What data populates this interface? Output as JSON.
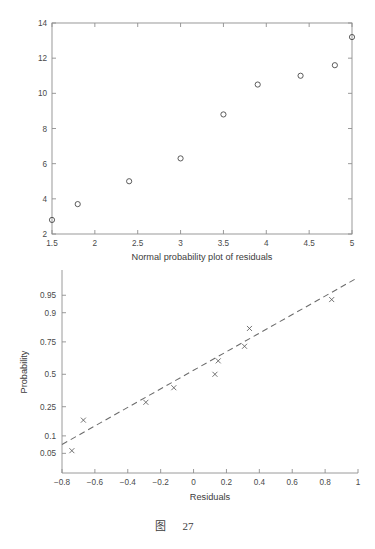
{
  "caption": {
    "prefix": "图",
    "number": "27"
  },
  "chart_data": [
    {
      "id": "residuals-scatter",
      "type": "scatter",
      "title": "",
      "subtitle": "",
      "xlabel": "Normal probability plot of residuals",
      "ylabel": "",
      "xlim": [
        1.5,
        5
      ],
      "ylim": [
        2,
        14
      ],
      "xticks": [
        "1.5",
        "2",
        "2.5",
        "3",
        "3.5",
        "4",
        "4.5",
        "5"
      ],
      "xtick_values": [
        1.5,
        2,
        2.5,
        3,
        3.5,
        4,
        4.5,
        5
      ],
      "yticks": [
        "2",
        "4",
        "6",
        "8",
        "10",
        "12",
        "14"
      ],
      "ytick_values": [
        2,
        4,
        6,
        8,
        10,
        12,
        14
      ],
      "grid": false,
      "legend": "none",
      "marker": "open-circle",
      "marker_color": "#4a4a4a",
      "x": [
        1.5,
        1.8,
        2.4,
        3.0,
        3.5,
        3.9,
        4.4,
        4.8,
        5.0
      ],
      "y": [
        2.8,
        3.7,
        5.0,
        6.3,
        8.8,
        10.5,
        11.0,
        11.6,
        13.2
      ],
      "points": [
        {
          "x": 1.5,
          "y": 2.8
        },
        {
          "x": 1.8,
          "y": 3.7
        },
        {
          "x": 2.4,
          "y": 5.0
        },
        {
          "x": 3.0,
          "y": 6.3
        },
        {
          "x": 3.5,
          "y": 8.8
        },
        {
          "x": 3.9,
          "y": 10.5
        },
        {
          "x": 4.4,
          "y": 11.0
        },
        {
          "x": 4.8,
          "y": 11.6
        },
        {
          "x": 5.0,
          "y": 13.2
        }
      ]
    },
    {
      "id": "normal-probability-plot",
      "type": "scatter",
      "title": "",
      "subtitle": "",
      "xlabel": "Residuals",
      "ylabel": "Probability",
      "xlim": [
        -0.8,
        1.0
      ],
      "ylim": [
        0.02,
        0.98
      ],
      "xticks": [
        "−0.8",
        "−0.6",
        "−0.4",
        "−0.2",
        "0",
        "0.2",
        "0.4",
        "0.6",
        "0.8",
        "1"
      ],
      "xtick_values": [
        -0.8,
        -0.6,
        -0.4,
        -0.2,
        0,
        0.2,
        0.4,
        0.6,
        0.8,
        1.0
      ],
      "yticks": [
        "0.05",
        "0.1",
        "0.25",
        "0.5",
        "0.75",
        "0.9",
        "0.95"
      ],
      "ytick_values": [
        0.05,
        0.1,
        0.25,
        0.5,
        0.75,
        0.9,
        0.95
      ],
      "yscale": "normal-probability",
      "grid": false,
      "legend": "none",
      "marker": "cross",
      "marker_color": "#5a5a5a",
      "reference_line": {
        "style": "dashed",
        "color": "#6b6b6b",
        "x": [
          -0.8,
          1.0
        ],
        "y": [
          0.072,
          0.978
        ]
      },
      "x": [
        -0.74,
        -0.67,
        -0.29,
        -0.12,
        0.13,
        0.15,
        0.31,
        0.34,
        0.84
      ],
      "y": [
        0.056,
        0.17,
        0.28,
        0.39,
        0.5,
        0.61,
        0.72,
        0.83,
        0.94
      ],
      "points": [
        {
          "x": -0.74,
          "y": 0.056
        },
        {
          "x": -0.67,
          "y": 0.17
        },
        {
          "x": -0.29,
          "y": 0.28
        },
        {
          "x": -0.12,
          "y": 0.39
        },
        {
          "x": 0.13,
          "y": 0.5
        },
        {
          "x": 0.15,
          "y": 0.61
        },
        {
          "x": 0.31,
          "y": 0.72
        },
        {
          "x": 0.34,
          "y": 0.83
        },
        {
          "x": 0.84,
          "y": 0.94
        }
      ]
    }
  ]
}
